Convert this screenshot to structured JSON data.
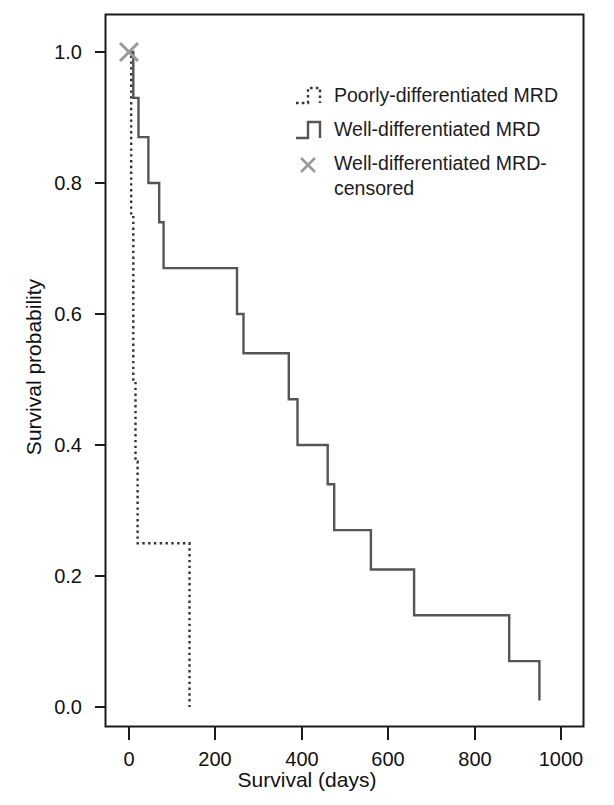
{
  "chart_data": {
    "type": "line",
    "title": "",
    "xlabel": "Survival (days)",
    "ylabel": "Survival probability",
    "xlim": [
      -45,
      1060
    ],
    "ylim": [
      -0.04,
      1.06
    ],
    "xticks": [
      0,
      200,
      400,
      600,
      800,
      1000
    ],
    "xtick_labels": [
      "0",
      "200",
      "400",
      "600",
      "800",
      "1000"
    ],
    "yticks": [
      0.0,
      0.2,
      0.4,
      0.6,
      0.8,
      1.0
    ],
    "ytick_labels": [
      "0.0",
      "0.2",
      "0.4",
      "0.6",
      "0.8",
      "1.0"
    ],
    "grid": false,
    "step_style": "post",
    "legend_position": "top-right-inside",
    "series": [
      {
        "name": "Poorly-differentiated MRD",
        "style": "dotted",
        "color": "#333333",
        "x": [
          0,
          5,
          10,
          15,
          20,
          140,
          140
        ],
        "y": [
          1.0,
          0.75,
          0.5,
          0.375,
          0.25,
          0.25,
          0.0
        ]
      },
      {
        "name": "Well-differentiated MRD",
        "style": "solid",
        "color": "#555555",
        "x": [
          0,
          10,
          22,
          45,
          70,
          80,
          250,
          265,
          370,
          390,
          460,
          475,
          550,
          560,
          660,
          870,
          880,
          950
        ],
        "y": [
          1.0,
          0.93,
          0.87,
          0.8,
          0.74,
          0.67,
          0.6,
          0.54,
          0.47,
          0.4,
          0.34,
          0.27,
          0.27,
          0.21,
          0.14,
          0.14,
          0.07,
          0.01
        ]
      }
    ],
    "markers": [
      {
        "name": "Well-differentiated MRD-censored",
        "symbol": "x",
        "color": "#9a9a9a",
        "points": [
          [
            0,
            1.0
          ]
        ]
      }
    ],
    "legend": [
      {
        "label": "Poorly-differentiated MRD",
        "symbol": "dotted-step",
        "color": "#333333"
      },
      {
        "label": "Well-differentiated MRD",
        "symbol": "solid-step",
        "color": "#555555"
      },
      {
        "label": "Well-differentiated MRD-censored",
        "symbol": "x-mark",
        "color": "#9a9a9a"
      }
    ]
  },
  "axes": {
    "xlabel": "Survival (days)",
    "ylabel": "Survival probability",
    "xtick_labels": [
      "0",
      "200",
      "400",
      "600",
      "800",
      "1000"
    ],
    "ytick_labels": [
      "0.0",
      "0.2",
      "0.4",
      "0.6",
      "0.8",
      "1.0"
    ]
  },
  "legend": {
    "item1": "Poorly-differentiated MRD",
    "item2": "Well-differentiated MRD",
    "item3_line1": "Well-differentiated MRD-",
    "item3_line2": "censored"
  }
}
